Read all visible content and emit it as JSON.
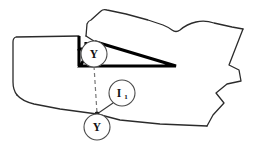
{
  "figure": {
    "background_color": "#ffffff",
    "width": 254,
    "height": 148,
    "outline_color": "#2b2b2b",
    "wedge_color": "#000000",
    "leader_color": "#777777"
  },
  "labels": {
    "view_top": "Y",
    "view_bottom": "Y",
    "section_main": "I",
    "section_subscript": "1"
  },
  "annotations": [
    {
      "name": "view-arrow-top",
      "text": "Y",
      "cx": 94,
      "cy": 54,
      "r": 13
    },
    {
      "name": "view-arrow-bottom",
      "text": "Y",
      "cx": 97,
      "cy": 127,
      "r": 13
    },
    {
      "name": "section-callout",
      "text": "I1",
      "cx": 122,
      "cy": 93,
      "r": 13
    }
  ],
  "geometry": {
    "outline_points": "86,23 100,10 119,14 142,21 163,26 176,31 186,25 198,22 213,24 230,27 243,28 235,47 228,64 238,70 240,80 227,83 215,92 223,102 212,114 206,125 160,124 120,120 80,114 50,108 26,101 15,92 14,72 14,40 15,36 79,36 79,49",
    "wedge_points": "79,49 79,66 175,65 96,42 86,42 86,49",
    "dashed_leader": "94,66 97,114",
    "solid_leader": "112,103 97,114",
    "section_dot": "97,114"
  }
}
